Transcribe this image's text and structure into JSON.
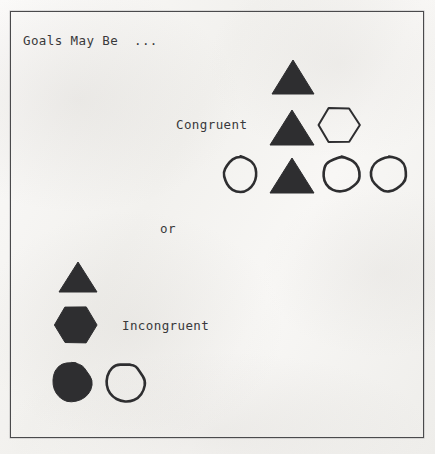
{
  "figure": {
    "title": "Goals May Be  ...",
    "or_label": "or",
    "caption_line1": "Across Different Vertical",
    "caption_line2": "Levels of the Organism.",
    "ink_color": "#2e2e30",
    "frame_color": "#4a4a4c",
    "paper_color": "#f7f6f4"
  },
  "groups": {
    "congruent": {
      "label": "Congruent",
      "shapes": [
        {
          "name": "triangle-filled-top",
          "type": "triangle",
          "fill": "solid",
          "x": 271,
          "y": 59,
          "w": 44,
          "h": 36
        },
        {
          "name": "triangle-filled-middle",
          "type": "triangle",
          "fill": "solid",
          "x": 269,
          "y": 109,
          "w": 46,
          "h": 37
        },
        {
          "name": "hexagon-outline-middle",
          "type": "hexagon",
          "fill": "outline",
          "x": 317,
          "y": 104,
          "w": 44,
          "h": 42
        },
        {
          "name": "circle-outline-bottom-left",
          "type": "circle",
          "fill": "outline",
          "x": 221,
          "y": 155,
          "w": 39,
          "h": 39
        },
        {
          "name": "triangle-filled-bottom",
          "type": "triangle",
          "fill": "solid",
          "x": 269,
          "y": 157,
          "w": 46,
          "h": 37
        },
        {
          "name": "circle-outline-bottom-mid",
          "type": "circle",
          "fill": "outline",
          "x": 321,
          "y": 154,
          "w": 41,
          "h": 40
        },
        {
          "name": "circle-outline-bottom-right",
          "type": "circle",
          "fill": "outline",
          "x": 369,
          "y": 154,
          "w": 40,
          "h": 40
        }
      ]
    },
    "incongruent": {
      "label": "Incongruent",
      "shapes": [
        {
          "name": "triangle-filled",
          "type": "triangle",
          "fill": "solid",
          "x": 58,
          "y": 261,
          "w": 40,
          "h": 32
        },
        {
          "name": "hexagon-filled",
          "type": "hexagon",
          "fill": "solid",
          "x": 53,
          "y": 303,
          "w": 45,
          "h": 44
        },
        {
          "name": "circle-filled",
          "type": "circle",
          "fill": "solid",
          "x": 49,
          "y": 360,
          "w": 45,
          "h": 45
        },
        {
          "name": "circle-outline-right",
          "type": "circle",
          "fill": "outline",
          "x": 103,
          "y": 361,
          "w": 44,
          "h": 44
        }
      ]
    }
  },
  "chart_data": {
    "type": "diagram",
    "title": "Goals May Be  ...",
    "subtitle": "Across Different Vertical Levels of the Organism.",
    "concept": "Goal congruence across vertical organizational levels",
    "annotations": [
      "Goals May Be  ...",
      "Congruent",
      "or",
      "Incongruent",
      "Across Different Vertical",
      "Levels of the Organism."
    ],
    "groups": [
      {
        "name": "Congruent",
        "description": "Shapes of matching type aligned across levels; a stacked column of identical filled triangles with differing shapes on adjacent levels",
        "rows": [
          {
            "level": 1,
            "shapes": [
              "triangle-filled"
            ]
          },
          {
            "level": 2,
            "shapes": [
              "triangle-filled",
              "hexagon-outline"
            ]
          },
          {
            "level": 3,
            "shapes": [
              "circle-outline",
              "triangle-filled",
              "circle-outline",
              "circle-outline"
            ]
          }
        ],
        "shape_counts": {
          "triangle-filled": 3,
          "hexagon-outline": 1,
          "circle-outline": 3
        }
      },
      {
        "name": "Incongruent",
        "description": "A vertical column of differing shapes, one per level, indicating misaligned goals",
        "rows": [
          {
            "level": 1,
            "shapes": [
              "triangle-filled"
            ]
          },
          {
            "level": 2,
            "shapes": [
              "hexagon-filled"
            ]
          },
          {
            "level": 3,
            "shapes": [
              "circle-filled",
              "circle-outline"
            ]
          }
        ],
        "shape_counts": {
          "triangle-filled": 1,
          "hexagon-filled": 1,
          "circle-filled": 1,
          "circle-outline": 1
        }
      }
    ],
    "legend": []
  }
}
